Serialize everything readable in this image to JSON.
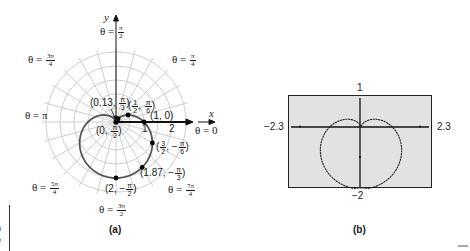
{
  "chart_data": [
    {
      "type": "line",
      "panel": "(a)",
      "description": "Polar graph of cardioid r = 1 - sin(theta) on polar grid",
      "grid": true,
      "axes": {
        "x_label": "x",
        "y_label": "y",
        "x_ticks": [
          "1",
          "2"
        ]
      },
      "angle_labels": [
        {
          "id": "t0",
          "theta": "0",
          "num": "",
          "den": "",
          "prefix": "θ = 0"
        },
        {
          "id": "t1",
          "theta": "π/4",
          "num": "π",
          "den": "4"
        },
        {
          "id": "t2",
          "theta": "π/2",
          "num": "π",
          "den": "2"
        },
        {
          "id": "t3",
          "theta": "3π/4",
          "num": "3π",
          "den": "4"
        },
        {
          "id": "t4",
          "theta": "π",
          "prefix": "θ = π"
        },
        {
          "id": "t5",
          "theta": "5π/4",
          "num": "5π",
          "den": "4"
        },
        {
          "id": "t6",
          "theta": "3π/2",
          "num": "3π",
          "den": "2"
        },
        {
          "id": "t7",
          "theta": "7π/4",
          "num": "7π",
          "den": "4"
        }
      ],
      "points": [
        {
          "r": 0,
          "theta": "π/2",
          "label": "(0, π/2)"
        },
        {
          "r": 0.13,
          "theta": "π/3",
          "label": "(0.13, π/3)"
        },
        {
          "r": 0.5,
          "theta": "π/6",
          "label": "(1/2, π/6)"
        },
        {
          "r": 1,
          "theta": "0",
          "label": "(1, 0)"
        },
        {
          "r": 1.5,
          "theta": "-π/6",
          "label": "(3/2, -π/6)"
        },
        {
          "r": 1.87,
          "theta": "-π/3",
          "label": "(1.87, -π/3)"
        },
        {
          "r": 2,
          "theta": "-π/2",
          "label": "(2, -π/2)"
        }
      ],
      "rmax": 2.5
    },
    {
      "type": "line",
      "panel": "(b)",
      "description": "Graphing calculator window showing cardioid r = 1 - sin(theta)",
      "xlim": [
        -2.3,
        2.3
      ],
      "ylim": [
        -2,
        1
      ],
      "window_labels": {
        "xmin": "−2.3",
        "xmax": "2.3",
        "ymin": "−2",
        "ymax": "1"
      }
    }
  ],
  "panel_a": {
    "caption": "(a)",
    "x_axis_label": "x",
    "y_axis_label": "y",
    "tick_1": "1",
    "tick_2": "2",
    "theta_prefix": "θ =",
    "theta0": "θ = 0",
    "theta_pi": "θ = π",
    "pi4": {
      "num": "π",
      "den": "4"
    },
    "pi2": {
      "num": "π",
      "den": "2"
    },
    "pi34": {
      "num": "3π",
      "den": "4"
    },
    "pi54": {
      "num": "5π",
      "den": "4"
    },
    "pi32": {
      "num": "3π",
      "den": "2"
    },
    "pi74": {
      "num": "7π",
      "den": "4"
    },
    "pt_origin": {
      "pre": "(0, ",
      "num": "π",
      "den": "2",
      "post": ")"
    },
    "pt_013": {
      "pre": "(0.13, ",
      "num": "π",
      "den": "3",
      "post": ")"
    },
    "pt_half": {
      "pre": "(",
      "n1": "1",
      "d1": "2",
      "mid": ", ",
      "num": "π",
      "den": "6",
      "post": ")"
    },
    "pt_10": "(1, 0)",
    "pt_32": {
      "pre": "(",
      "n1": "3",
      "d1": "2",
      "mid": ", −",
      "num": "π",
      "den": "6",
      "post": ")"
    },
    "pt_187": {
      "pre": "(1.87, −",
      "num": "π",
      "den": "3",
      "post": ")"
    },
    "pt_2": {
      "pre": "(2, −",
      "num": "π",
      "den": "2",
      "post": ")"
    }
  },
  "panel_b": {
    "caption": "(b)",
    "ymax": "1",
    "ymin": "−2",
    "xmin": "−2.3",
    "xmax": "2.3"
  },
  "margin": {
    "left_fragment_1": "n",
    "left_fragment_2": "e",
    "top_fragment": ")"
  }
}
